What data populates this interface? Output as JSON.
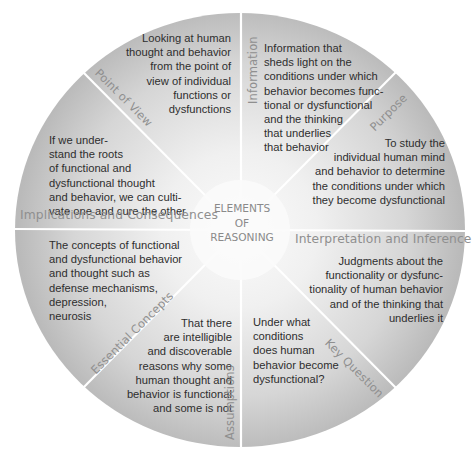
{
  "diagram": {
    "center_label": "ELEMENTS\nOF\nREASONING",
    "colors": {
      "ring_center": "#fafafa",
      "ring_edge": "#bdbdbd",
      "divider": "#ffffff",
      "segment_label": "#8f8f8f",
      "body_text": "#2e2e2e"
    },
    "segments": [
      {
        "label": "Information",
        "text": "Information that\nsheds light on the\nconditions under which\nbehavior becomes func-\ntional or dysfunctional\nand the thinking\nthat underlies\nthat behavior"
      },
      {
        "label": "Purpose",
        "text": "To study the\nindividual human mind\nand behavior to determine\nthe conditions under which\nthey become dysfunctional"
      },
      {
        "label": "Interpretation and Inference",
        "text": "Judgments about the\nfunctionality or dysfunc-\ntionality of human behavior\nand of the thinking that\nunderlies it"
      },
      {
        "label": "Key Question",
        "text": "Under what\nconditions\ndoes human\nbehavior become\ndysfunctional?"
      },
      {
        "label": "Assumptions",
        "text": "That there\nare intelligible\nand discoverable\nreasons why some\nhuman thought and\nbehavior is functional\nand some is not"
      },
      {
        "label": "Essential Concepts",
        "text": "The concepts of functional\nand dysfunctional behavior\nand thought such as\ndefense mechanisms,\ndepression,\nneurosis"
      },
      {
        "label": "Implications and Consequences",
        "text": "If we under-\nstand the roots\nof functional and\ndysfunctional thought\nand behavior, we can culti-\nvate one and cure the other"
      },
      {
        "label": "Point of View",
        "text": "Looking at human\nthought and behavior\nfrom the point of\nview of individual\nfunctions or\ndysfunctions"
      }
    ]
  }
}
